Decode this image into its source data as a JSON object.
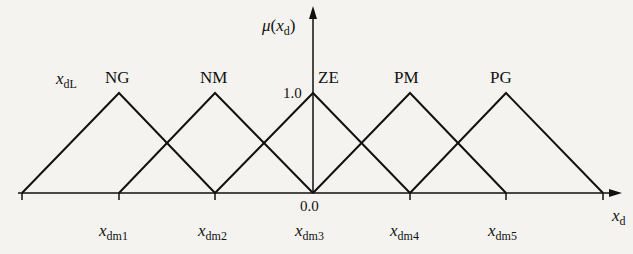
{
  "diagram": {
    "type": "fuzzy-membership-functions",
    "y_axis": {
      "label_var": "μ",
      "label_arg": "x",
      "label_arg_sub": "d",
      "peak_value": "1.0"
    },
    "x_axis": {
      "label_var": "x",
      "label_sub": "d",
      "origin_value": "0.0"
    },
    "left_label": {
      "var": "x",
      "sub": "dL"
    },
    "sets": [
      {
        "name": "NG",
        "peak_x": "x_dm1"
      },
      {
        "name": "NM",
        "peak_x": "x_dm2"
      },
      {
        "name": "ZE",
        "peak_x": "x_dm3"
      },
      {
        "name": "PM",
        "peak_x": "x_dm4"
      },
      {
        "name": "PG",
        "peak_x": "x_dm5"
      }
    ],
    "ticks": [
      {
        "var": "x",
        "sub": "dm1"
      },
      {
        "var": "x",
        "sub": "dm2"
      },
      {
        "var": "x",
        "sub": "dm3"
      },
      {
        "var": "x",
        "sub": "dm4"
      },
      {
        "var": "x",
        "sub": "dm5"
      }
    ]
  }
}
